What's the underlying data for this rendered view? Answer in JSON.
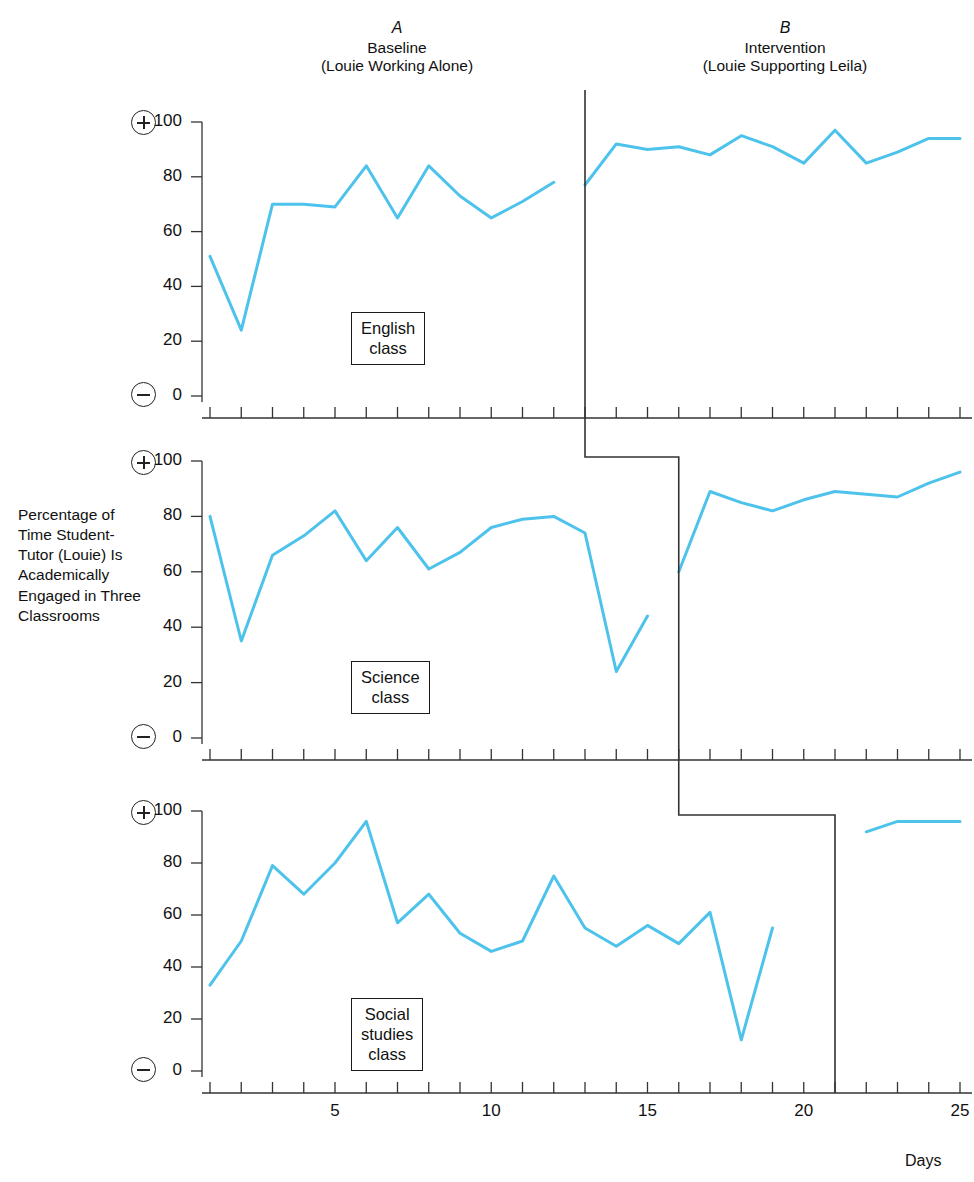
{
  "phases": [
    {
      "letter": "A",
      "line1": "Baseline",
      "line2": "(Louie Working Alone)"
    },
    {
      "letter": "B",
      "line1": "Intervention",
      "line2": "(Louie Supporting Leila)"
    }
  ],
  "axis": {
    "y_label": "Percentage of Time Student-Tutor (Louie) Is Academically Engaged in Three Classrooms",
    "x_title": "Days",
    "y_ticks": [
      "0",
      "20",
      "40",
      "60",
      "80",
      "100"
    ],
    "x_ticks": [
      "5",
      "10",
      "15",
      "20",
      "25"
    ],
    "plus_glyph": "plus-sign-icon",
    "minus_glyph": "minus-sign-icon"
  },
  "panel_labels": [
    {
      "line1": "English",
      "line2": "class",
      "line3": ""
    },
    {
      "line1": "Science",
      "line2": "class",
      "line3": ""
    },
    {
      "line1": "Social",
      "line2": "studies",
      "line3": "class"
    }
  ],
  "colors": {
    "data_line": "#4DC3EC",
    "axis": "#333333",
    "phase_line": "#333333",
    "text": "#111111"
  },
  "chart_data": {
    "type": "line",
    "title": "Percentage of Time Student-Tutor (Louie) Is Academically Engaged in Three Classrooms",
    "xlabel": "Days",
    "ylabel": "Percentage of Time Student-Tutor (Louie) Is Academically Engaged in Three Classrooms",
    "xlim": [
      1,
      25
    ],
    "ylim": [
      0,
      100
    ],
    "ytick_step": 20,
    "grid": false,
    "legend": "none",
    "design": "multiple-baseline across settings",
    "phase_labels": [
      "A Baseline (Louie Working Alone)",
      "B Intervention (Louie Supporting Leila)"
    ],
    "panels": [
      {
        "name": "English class",
        "phase_change_day": 13,
        "series": [
          {
            "name": "Baseline",
            "x": [
              1,
              2,
              3,
              4,
              5,
              6,
              7,
              8,
              9,
              10,
              11,
              12
            ],
            "values": [
              51,
              24,
              70,
              70,
              69,
              84,
              65,
              84,
              73,
              65,
              71,
              78
            ]
          },
          {
            "name": "Intervention",
            "x": [
              13,
              14,
              15,
              16,
              17,
              18,
              19,
              20,
              21,
              22,
              23,
              24,
              25
            ],
            "values": [
              77,
              92,
              90,
              91,
              88,
              95,
              91,
              85,
              97,
              85,
              89,
              94,
              94
            ]
          }
        ]
      },
      {
        "name": "Science class",
        "phase_change_day": 16,
        "series": [
          {
            "name": "Baseline",
            "x": [
              1,
              2,
              3,
              4,
              5,
              6,
              7,
              8,
              9,
              10,
              11,
              12,
              13,
              14,
              15
            ],
            "values": [
              80,
              35,
              66,
              73,
              82,
              64,
              76,
              61,
              67,
              76,
              79,
              80,
              74,
              24,
              44
            ]
          },
          {
            "name": "Intervention",
            "x": [
              16,
              17,
              18,
              19,
              20,
              21,
              22,
              23,
              24,
              25
            ],
            "values": [
              60,
              89,
              85,
              82,
              86,
              89,
              88,
              87,
              92,
              96
            ]
          }
        ]
      },
      {
        "name": "Social studies class",
        "phase_change_day": 21,
        "series": [
          {
            "name": "Baseline",
            "x": [
              1,
              2,
              3,
              4,
              5,
              6,
              7,
              8,
              9,
              10,
              11,
              12,
              13,
              14,
              15,
              16,
              17,
              18,
              19
            ],
            "values": [
              33,
              50,
              79,
              68,
              80,
              96,
              57,
              68,
              53,
              46,
              50,
              75,
              55,
              48,
              56,
              49,
              61,
              12,
              55
            ]
          },
          {
            "name": "Intervention",
            "x": [
              22,
              23,
              24,
              25
            ],
            "values": [
              92,
              96,
              96,
              96
            ]
          }
        ]
      }
    ]
  }
}
